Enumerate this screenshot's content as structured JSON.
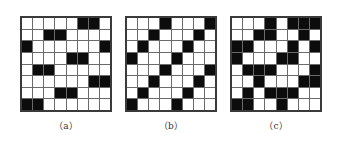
{
  "figure": {
    "panels": [
      {
        "label": "（a）",
        "grid": [
          [
            0,
            0,
            0,
            0,
            0,
            1,
            1,
            0
          ],
          [
            0,
            0,
            1,
            1,
            0,
            0,
            0,
            0
          ],
          [
            1,
            0,
            0,
            0,
            0,
            0,
            0,
            1
          ],
          [
            0,
            0,
            0,
            0,
            1,
            1,
            0,
            0
          ],
          [
            0,
            1,
            1,
            0,
            0,
            0,
            0,
            0
          ],
          [
            0,
            0,
            0,
            0,
            0,
            0,
            1,
            1
          ],
          [
            0,
            0,
            0,
            1,
            1,
            0,
            0,
            0
          ],
          [
            1,
            1,
            0,
            0,
            0,
            0,
            0,
            0
          ]
        ]
      },
      {
        "label": "（b）",
        "grid": [
          [
            0,
            0,
            0,
            1,
            0,
            0,
            0,
            1
          ],
          [
            0,
            0,
            1,
            0,
            0,
            0,
            1,
            0
          ],
          [
            0,
            1,
            0,
            0,
            0,
            1,
            0,
            0
          ],
          [
            1,
            0,
            0,
            0,
            1,
            0,
            0,
            0
          ],
          [
            0,
            0,
            0,
            1,
            0,
            0,
            0,
            1
          ],
          [
            0,
            0,
            1,
            0,
            0,
            0,
            1,
            0
          ],
          [
            0,
            1,
            0,
            0,
            0,
            1,
            0,
            0
          ],
          [
            1,
            0,
            0,
            0,
            1,
            0,
            0,
            0
          ]
        ]
      },
      {
        "label": "（c）",
        "grid": [
          [
            0,
            0,
            0,
            1,
            0,
            1,
            1,
            1
          ],
          [
            0,
            0,
            1,
            1,
            0,
            0,
            1,
            0
          ],
          [
            1,
            1,
            0,
            0,
            0,
            1,
            0,
            1
          ],
          [
            1,
            0,
            0,
            0,
            1,
            1,
            0,
            0
          ],
          [
            0,
            1,
            1,
            1,
            0,
            0,
            0,
            1
          ],
          [
            0,
            0,
            1,
            0,
            0,
            0,
            1,
            1
          ],
          [
            0,
            1,
            0,
            1,
            1,
            1,
            0,
            0
          ],
          [
            1,
            1,
            0,
            0,
            1,
            0,
            0,
            0
          ]
        ]
      }
    ],
    "colors": {
      "filled": "#0c0c0c",
      "empty": "#ffffff",
      "gridline": "#6a6a6a"
    }
  }
}
